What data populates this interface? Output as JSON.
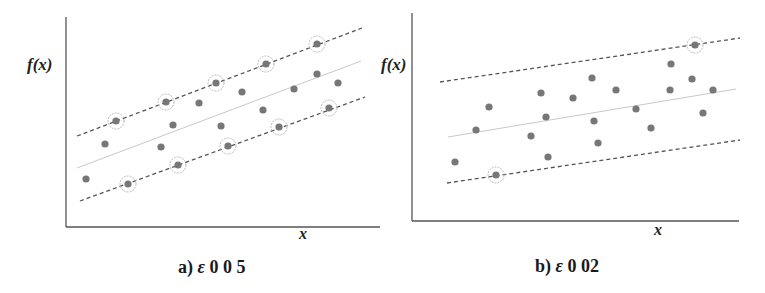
{
  "chart_data": [
    {
      "type": "scatter",
      "title": "",
      "caption": "a) ε 0 0 5",
      "caption_parts": {
        "prefix": "a) ",
        "symbol": "ε",
        "value": " 0 0 5"
      },
      "xlabel": "x",
      "ylabel": "f(x)",
      "grid": false,
      "legend": null,
      "lines": {
        "upper_margin": {
          "style": "dashed",
          "x1": 77,
          "y1": 136,
          "x2": 362,
          "y2": 28
        },
        "regression": {
          "style": "solid",
          "x1": 77,
          "y1": 168,
          "x2": 361,
          "y2": 61
        },
        "lower_margin": {
          "style": "dashed",
          "x1": 80,
          "y1": 201,
          "x2": 365,
          "y2": 97
        }
      },
      "support_vectors": [
        [
          116,
          121
        ],
        [
          166,
          102
        ],
        [
          216,
          83
        ],
        [
          266,
          64
        ],
        [
          317,
          44
        ],
        [
          128,
          184
        ],
        [
          178,
          165
        ],
        [
          228,
          146
        ],
        [
          279,
          127
        ],
        [
          329,
          108
        ]
      ],
      "points": [
        [
          86,
          179
        ],
        [
          105,
          144
        ],
        [
          161,
          147
        ],
        [
          173,
          125
        ],
        [
          199,
          103
        ],
        [
          221,
          126
        ],
        [
          242,
          92
        ],
        [
          263,
          110
        ],
        [
          294,
          89
        ],
        [
          317,
          74
        ],
        [
          338,
          83
        ]
      ],
      "axes": {
        "origin_x": 66,
        "origin_y": 227,
        "y_top": 17,
        "x_right": 380
      }
    },
    {
      "type": "scatter",
      "title": "",
      "caption": "b) ε 0 02",
      "caption_parts": {
        "prefix": "b) ",
        "symbol": "ε",
        "value": " 0 02"
      },
      "xlabel": "x",
      "ylabel": "f(x)",
      "grid": false,
      "legend": null,
      "lines": {
        "upper_margin": {
          "style": "dashed",
          "x1": 440,
          "y1": 82,
          "x2": 740,
          "y2": 38
        },
        "regression": {
          "style": "solid",
          "x1": 448,
          "y1": 137,
          "x2": 736,
          "y2": 89
        },
        "lower_margin": {
          "style": "dashed",
          "x1": 447,
          "y1": 183,
          "x2": 740,
          "y2": 140
        }
      },
      "support_vectors": [
        [
          496,
          175
        ],
        [
          695,
          45
        ]
      ],
      "points": [
        [
          455,
          162
        ],
        [
          476,
          130
        ],
        [
          489,
          107
        ],
        [
          531,
          136
        ],
        [
          541,
          93
        ],
        [
          546,
          117
        ],
        [
          548,
          157
        ],
        [
          573,
          98
        ],
        [
          592,
          78
        ],
        [
          594,
          121
        ],
        [
          598,
          143
        ],
        [
          616,
          90
        ],
        [
          636,
          109
        ],
        [
          651,
          128
        ],
        [
          671,
          64
        ],
        [
          670,
          90
        ],
        [
          692,
          79
        ],
        [
          703,
          113
        ],
        [
          713,
          90
        ]
      ],
      "axes": {
        "origin_x": 412,
        "origin_y": 221,
        "y_top": 13,
        "x_right": 739
      }
    }
  ],
  "style": {
    "point_color": "#777777",
    "dash_color": "#555555",
    "solid_color": "#c8c8c8",
    "axis_color": "#555555",
    "circle_color": "#bbbbbb"
  },
  "labels": {
    "a_ylabel": "f(x)",
    "a_xlabel": "x",
    "b_ylabel": "f(x)",
    "b_xlabel": "x"
  }
}
